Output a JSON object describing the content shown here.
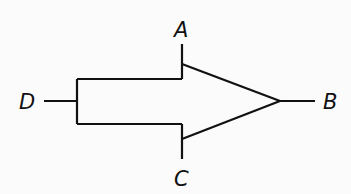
{
  "diagram": {
    "type": "gate-symbol",
    "labels": {
      "A": "A",
      "B": "B",
      "C": "C",
      "D": "D"
    },
    "colors": {
      "stroke": "#111111",
      "background": "#fbfbfb"
    }
  }
}
